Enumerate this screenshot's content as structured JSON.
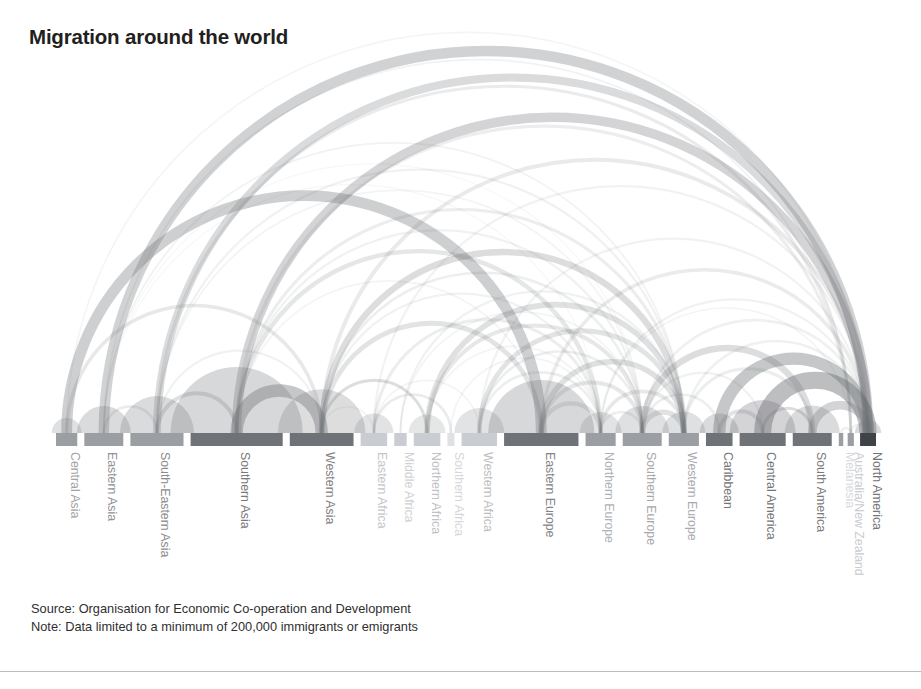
{
  "title": "Migration around the world",
  "footer": {
    "source": "Source: Organisation for Economic Co-operation and Development",
    "note": "Note: Data limited to a minimum of 200,000 immigrants or emigrants"
  },
  "colors": {
    "node_dark": "#6f7276",
    "node_mid": "#9b9ea2",
    "node_light": "#c9ccd0",
    "node_very_light": "#dfe1e3",
    "node_darkest": "#3f4246",
    "arc": "#6f7276",
    "title": "#231f20",
    "footer_text": "#2f2f2f",
    "divider": "#b9bcc0",
    "background": "#ffffff"
  },
  "layout": {
    "axis_y": 433,
    "bar_height": 13,
    "axis_left": 56,
    "axis_right": 876,
    "label_top": 452,
    "svg_width": 921,
    "svg_height": 689
  },
  "chart_data": {
    "type": "arc_diagram",
    "title": "Migration around the world",
    "xlabel": "",
    "ylabel": "",
    "grid": false,
    "legend": "none",
    "annotations": [
      "Source: Organisation for Economic Co-operation and Development",
      "Note: Data limited to a minimum of 200,000 immigrants or emigrants"
    ],
    "nodes": [
      {
        "id": 0,
        "label": "Central Asia",
        "x": 56,
        "width": 24,
        "weight": 0.55,
        "shade": "node_mid"
      },
      {
        "id": 1,
        "label": "Eastern Asia",
        "x": 88,
        "width": 44,
        "weight": 0.68,
        "shade": "node_mid"
      },
      {
        "id": 2,
        "label": "South-Eastern Asia",
        "x": 140,
        "width": 60,
        "weight": 0.72,
        "shade": "node_mid"
      },
      {
        "id": 3,
        "label": "Southern Asia",
        "x": 208,
        "width": 104,
        "weight": 0.85,
        "shade": "node_dark"
      },
      {
        "id": 4,
        "label": "Western Asia",
        "x": 320,
        "width": 72,
        "weight": 0.8,
        "shade": "node_dark"
      },
      {
        "id": 5,
        "label": "Eastern Africa",
        "x": 400,
        "width": 30,
        "weight": 0.3,
        "shade": "node_light"
      },
      {
        "id": 6,
        "label": "Middle Africa",
        "x": 438,
        "width": 14,
        "weight": 0.22,
        "shade": "node_light"
      },
      {
        "id": 7,
        "label": "Northern Africa",
        "x": 460,
        "width": 30,
        "weight": 0.34,
        "shade": "node_light"
      },
      {
        "id": 8,
        "label": "Southern Africa",
        "x": 498,
        "width": 8,
        "weight": 0.18,
        "shade": "node_very_light"
      },
      {
        "id": 9,
        "label": "Western Africa",
        "x": 514,
        "width": 40,
        "weight": 0.36,
        "shade": "node_light"
      },
      {
        "id": 10,
        "label": "Eastern Europe",
        "x": 562,
        "width": 84,
        "weight": 0.78,
        "shade": "node_dark"
      },
      {
        "id": 11,
        "label": "Northern Europe",
        "x": 654,
        "width": 34,
        "weight": 0.45,
        "shade": "node_mid"
      },
      {
        "id": 12,
        "label": "Southern Europe",
        "x": 696,
        "width": 44,
        "weight": 0.52,
        "shade": "node_mid"
      },
      {
        "id": 13,
        "label": "Western Europe",
        "x": 748,
        "width": 34,
        "weight": 0.5,
        "shade": "node_mid"
      },
      {
        "id": 14,
        "label": "Caribbean",
        "x": 790,
        "width": 30,
        "weight": 0.88,
        "shade": "node_dark"
      },
      {
        "id": 15,
        "label": "Central America",
        "x": 828,
        "width": 52,
        "weight": 0.92,
        "shade": "node_dark"
      },
      {
        "id": 16,
        "label": "South America",
        "x": 888,
        "width": 44,
        "weight": 0.84,
        "shade": "node_dark"
      },
      {
        "id": 17,
        "label": "Melanesia",
        "x": 940,
        "width": 5,
        "weight": 0.16,
        "shade": "node_mid"
      },
      {
        "id": 18,
        "label": "Australia/New Zealand",
        "x": 950,
        "width": 7,
        "weight": 0.26,
        "shade": "node_mid"
      },
      {
        "id": 19,
        "label": "North America",
        "x": 964,
        "width": 18,
        "weight": 1.0,
        "shade": "node_darkest"
      }
    ],
    "links": [
      {
        "source": 0,
        "target": 10,
        "value": 26,
        "opacity": 0.34
      },
      {
        "source": 0,
        "target": 4,
        "value": 7,
        "opacity": 0.16
      },
      {
        "source": 0,
        "target": 19,
        "value": 3,
        "opacity": 0.07
      },
      {
        "source": 1,
        "target": 19,
        "value": 25,
        "opacity": 0.32
      },
      {
        "source": 1,
        "target": 2,
        "value": 5,
        "opacity": 0.14
      },
      {
        "source": 1,
        "target": 13,
        "value": 3,
        "opacity": 0.09
      },
      {
        "source": 1,
        "target": 18,
        "value": 3,
        "opacity": 0.09
      },
      {
        "source": 1,
        "target": 12,
        "value": 2,
        "opacity": 0.06
      },
      {
        "source": 1,
        "target": 11,
        "value": 2,
        "opacity": 0.06
      },
      {
        "source": 2,
        "target": 19,
        "value": 18,
        "opacity": 0.26
      },
      {
        "source": 2,
        "target": 3,
        "value": 8,
        "opacity": 0.22
      },
      {
        "source": 2,
        "target": 18,
        "value": 6,
        "opacity": 0.14
      },
      {
        "source": 2,
        "target": 13,
        "value": 4,
        "opacity": 0.1
      },
      {
        "source": 2,
        "target": 12,
        "value": 3,
        "opacity": 0.08
      },
      {
        "source": 2,
        "target": 4,
        "value": 4,
        "opacity": 0.1
      },
      {
        "source": 3,
        "target": 4,
        "value": 30,
        "opacity": 0.4
      },
      {
        "source": 3,
        "target": 19,
        "value": 22,
        "opacity": 0.3
      },
      {
        "source": 3,
        "target": 11,
        "value": 9,
        "opacity": 0.18
      },
      {
        "source": 3,
        "target": 13,
        "value": 6,
        "opacity": 0.13
      },
      {
        "source": 3,
        "target": 18,
        "value": 6,
        "opacity": 0.13
      },
      {
        "source": 3,
        "target": 12,
        "value": 4,
        "opacity": 0.1
      },
      {
        "source": 3,
        "target": 10,
        "value": 3,
        "opacity": 0.08
      },
      {
        "source": 4,
        "target": 13,
        "value": 14,
        "opacity": 0.24
      },
      {
        "source": 4,
        "target": 10,
        "value": 10,
        "opacity": 0.2
      },
      {
        "source": 4,
        "target": 19,
        "value": 8,
        "opacity": 0.15
      },
      {
        "source": 4,
        "target": 12,
        "value": 5,
        "opacity": 0.12
      },
      {
        "source": 4,
        "target": 11,
        "value": 4,
        "opacity": 0.1
      },
      {
        "source": 4,
        "target": 7,
        "value": 5,
        "opacity": 0.12
      },
      {
        "source": 5,
        "target": 11,
        "value": 6,
        "opacity": 0.13
      },
      {
        "source": 5,
        "target": 8,
        "value": 5,
        "opacity": 0.14
      },
      {
        "source": 5,
        "target": 19,
        "value": 4,
        "opacity": 0.09
      },
      {
        "source": 5,
        "target": 4,
        "value": 3,
        "opacity": 0.08
      },
      {
        "source": 6,
        "target": 13,
        "value": 4,
        "opacity": 0.1
      },
      {
        "source": 6,
        "target": 12,
        "value": 3,
        "opacity": 0.08
      },
      {
        "source": 7,
        "target": 13,
        "value": 12,
        "opacity": 0.22
      },
      {
        "source": 7,
        "target": 12,
        "value": 8,
        "opacity": 0.17
      },
      {
        "source": 7,
        "target": 4,
        "value": 6,
        "opacity": 0.13
      },
      {
        "source": 7,
        "target": 11,
        "value": 3,
        "opacity": 0.08
      },
      {
        "source": 8,
        "target": 11,
        "value": 3,
        "opacity": 0.08
      },
      {
        "source": 9,
        "target": 13,
        "value": 10,
        "opacity": 0.2
      },
      {
        "source": 9,
        "target": 11,
        "value": 5,
        "opacity": 0.12
      },
      {
        "source": 9,
        "target": 12,
        "value": 5,
        "opacity": 0.12
      },
      {
        "source": 9,
        "target": 19,
        "value": 4,
        "opacity": 0.09
      },
      {
        "source": 9,
        "target": 5,
        "value": 3,
        "opacity": 0.08
      },
      {
        "source": 10,
        "target": 11,
        "value": 9,
        "opacity": 0.18
      },
      {
        "source": 10,
        "target": 13,
        "value": 12,
        "opacity": 0.22
      },
      {
        "source": 10,
        "target": 12,
        "value": 8,
        "opacity": 0.17
      },
      {
        "source": 10,
        "target": 19,
        "value": 7,
        "opacity": 0.14
      },
      {
        "source": 11,
        "target": 13,
        "value": 7,
        "opacity": 0.16
      },
      {
        "source": 11,
        "target": 12,
        "value": 5,
        "opacity": 0.12
      },
      {
        "source": 11,
        "target": 19,
        "value": 4,
        "opacity": 0.1
      },
      {
        "source": 12,
        "target": 13,
        "value": 11,
        "opacity": 0.21
      },
      {
        "source": 12,
        "target": 19,
        "value": 5,
        "opacity": 0.11
      },
      {
        "source": 13,
        "target": 19,
        "value": 5,
        "opacity": 0.11
      },
      {
        "source": 14,
        "target": 19,
        "value": 30,
        "opacity": 0.4
      },
      {
        "source": 14,
        "target": 15,
        "value": 8,
        "opacity": 0.2
      },
      {
        "source": 14,
        "target": 12,
        "value": 5,
        "opacity": 0.12
      },
      {
        "source": 15,
        "target": 19,
        "value": 44,
        "opacity": 0.46
      },
      {
        "source": 15,
        "target": 16,
        "value": 6,
        "opacity": 0.14
      },
      {
        "source": 15,
        "target": 12,
        "value": 4,
        "opacity": 0.1
      },
      {
        "source": 16,
        "target": 19,
        "value": 20,
        "opacity": 0.3
      },
      {
        "source": 16,
        "target": 12,
        "value": 14,
        "opacity": 0.24
      },
      {
        "source": 16,
        "target": 13,
        "value": 6,
        "opacity": 0.13
      },
      {
        "source": 16,
        "target": 15,
        "value": 5,
        "opacity": 0.12
      },
      {
        "source": 17,
        "target": 18,
        "value": 4,
        "opacity": 0.12
      },
      {
        "source": 18,
        "target": 19,
        "value": 4,
        "opacity": 0.1
      },
      {
        "source": 18,
        "target": 11,
        "value": 3,
        "opacity": 0.08
      },
      {
        "source": 0,
        "target": 0,
        "value": 6,
        "opacity": 0.22
      },
      {
        "source": 1,
        "target": 1,
        "value": 10,
        "opacity": 0.26
      },
      {
        "source": 2,
        "target": 2,
        "value": 14,
        "opacity": 0.26
      },
      {
        "source": 3,
        "target": 3,
        "value": 28,
        "opacity": 0.28
      },
      {
        "source": 4,
        "target": 4,
        "value": 16,
        "opacity": 0.24
      },
      {
        "source": 5,
        "target": 5,
        "value": 9,
        "opacity": 0.2
      },
      {
        "source": 7,
        "target": 7,
        "value": 7,
        "opacity": 0.18
      },
      {
        "source": 9,
        "target": 9,
        "value": 10,
        "opacity": 0.2
      },
      {
        "source": 10,
        "target": 10,
        "value": 22,
        "opacity": 0.28
      },
      {
        "source": 11,
        "target": 11,
        "value": 8,
        "opacity": 0.2
      },
      {
        "source": 12,
        "target": 12,
        "value": 10,
        "opacity": 0.22
      },
      {
        "source": 13,
        "target": 13,
        "value": 9,
        "opacity": 0.22
      },
      {
        "source": 14,
        "target": 14,
        "value": 9,
        "opacity": 0.26
      },
      {
        "source": 15,
        "target": 15,
        "value": 14,
        "opacity": 0.3
      },
      {
        "source": 16,
        "target": 16,
        "value": 11,
        "opacity": 0.26
      },
      {
        "source": 19,
        "target": 19,
        "value": 8,
        "opacity": 0.26
      }
    ]
  }
}
